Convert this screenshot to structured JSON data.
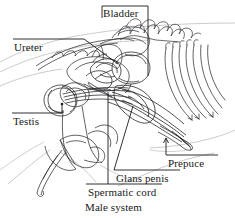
{
  "figure": {
    "title": "Male system",
    "kind": "anatomical-line-diagram",
    "background_color": "#ffffff",
    "ink_color": "#1a1a1a",
    "faint_ink_color": "#9a9aa0",
    "width": 235,
    "height": 218
  },
  "labels": {
    "bladder": "Bladder",
    "ureter": "Ureter",
    "testis": "Testis",
    "prepuce": "Prepuce",
    "glans_penis": "Glans penis",
    "spermatic_cord": "Spermatic cord"
  },
  "caption": "Male system",
  "leaders": [
    {
      "name": "bladder-leader",
      "style": "bracket-down",
      "from_label": "Bladder"
    },
    {
      "name": "ureter-leader",
      "style": "underline-then-diagonal",
      "from_label": "Ureter"
    },
    {
      "name": "testis-leader",
      "style": "underline-then-dot",
      "from_label": "Testis"
    },
    {
      "name": "prepuce-leader",
      "style": "bracket-up-arrow",
      "from_label": "Prepuce"
    },
    {
      "name": "glans-penis-leader",
      "style": "underline-then-diagonal",
      "from_label": "Glans penis"
    },
    {
      "name": "spermatic-cord-leader",
      "style": "underline-then-vertical",
      "from_label": "Spermatic cord"
    }
  ]
}
